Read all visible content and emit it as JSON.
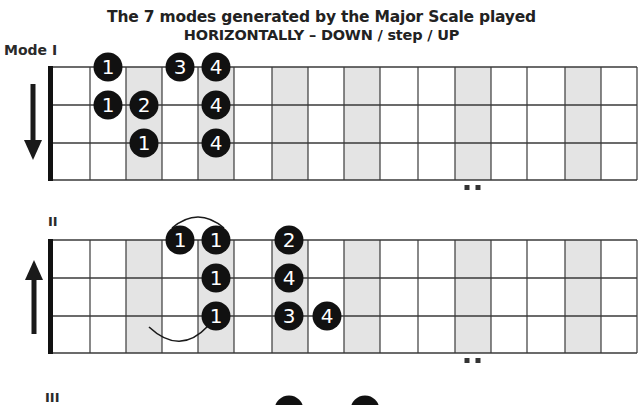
{
  "title": {
    "line1": "The 7 modes generated by the Major Scale played",
    "line2": "HORIZONTALLY – DOWN / step / UP"
  },
  "colors": {
    "note_fill": "#111111",
    "note_text": "#ffffff",
    "shade": "#e4e4e4",
    "line": "#3a3a3a",
    "nut": "#111111"
  },
  "fretboard_geometry": {
    "fret_x": [
      52,
      90,
      126,
      162,
      198,
      234,
      272,
      308,
      344,
      380,
      418,
      455,
      491,
      527,
      565,
      601,
      637
    ],
    "shaded_fret_columns": [
      3,
      5,
      7,
      9,
      12,
      15
    ],
    "strings": 3
  },
  "modes": [
    {
      "label": "Mode I",
      "direction": "down",
      "string_y": [
        67,
        105,
        143
      ],
      "bottom_y": 180,
      "position_dots_x": [
        467,
        478
      ],
      "notes": [
        {
          "string": 0,
          "x": 108,
          "finger": "1"
        },
        {
          "string": 0,
          "x": 180,
          "finger": "3"
        },
        {
          "string": 0,
          "x": 216,
          "finger": "4"
        },
        {
          "string": 1,
          "x": 108,
          "finger": "1"
        },
        {
          "string": 1,
          "x": 144,
          "finger": "2"
        },
        {
          "string": 1,
          "x": 216,
          "finger": "4"
        },
        {
          "string": 2,
          "x": 144,
          "finger": "1"
        },
        {
          "string": 2,
          "x": 216,
          "finger": "4"
        }
      ],
      "slurs": []
    },
    {
      "label": "II",
      "direction": "up",
      "string_y": [
        240,
        278,
        316
      ],
      "bottom_y": 353,
      "position_dots_x": [
        467,
        478
      ],
      "notes": [
        {
          "string": 0,
          "x": 180,
          "finger": "1"
        },
        {
          "string": 0,
          "x": 216,
          "finger": "1"
        },
        {
          "string": 0,
          "x": 289,
          "finger": "2"
        },
        {
          "string": 1,
          "x": 216,
          "finger": "1"
        },
        {
          "string": 1,
          "x": 289,
          "finger": "4"
        },
        {
          "string": 2,
          "x": 216,
          "finger": "1"
        },
        {
          "string": 2,
          "x": 289,
          "finger": "3"
        },
        {
          "string": 2,
          "x": 327,
          "finger": "4"
        }
      ],
      "slurs": [
        {
          "type": "over",
          "path": "M172 228 Q198 206 224 228"
        },
        {
          "type": "under",
          "path": "M149 327 Q180 356 208 326"
        }
      ]
    },
    {
      "label": "III",
      "partial": true
    }
  ]
}
